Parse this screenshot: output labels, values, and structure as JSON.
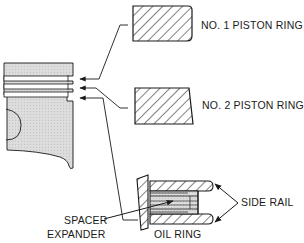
{
  "diagram": {
    "labels": {
      "ring1": "NO. 1 PISTON RING",
      "ring2": "NO. 2 PISTON RING",
      "side_rail": "SIDE RAIL",
      "spacer_line1": "SPACER",
      "spacer_line2": "EXPANDER",
      "oil_ring": "OIL RING"
    },
    "colors": {
      "ink": "#1a1a1a",
      "piston_fill": "#d8d8d8",
      "spacer_fill": "#c9c9c9",
      "background": "#ffffff"
    },
    "components": [
      {
        "name": "piston",
        "type": "cutaway"
      },
      {
        "name": "no-1-piston-ring",
        "type": "rectangular cross-section, chamfered outer corners"
      },
      {
        "name": "no-2-piston-ring",
        "type": "tapered cross-section"
      },
      {
        "name": "oil-ring",
        "type": "three-piece",
        "parts": [
          "side-rail-top",
          "spacer-expander",
          "side-rail-bottom"
        ]
      }
    ]
  }
}
